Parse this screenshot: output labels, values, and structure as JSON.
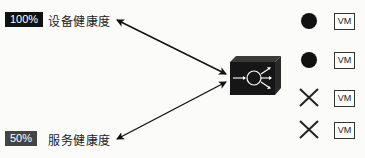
{
  "health": [
    {
      "percent": "100%",
      "label": "设备健康度",
      "badge_color": "#111111"
    },
    {
      "percent": "50%",
      "label": "服务健康度",
      "badge_color": "#444444"
    }
  ],
  "device": {
    "icon": "load-balancer-icon"
  },
  "servers": [
    {
      "status": "up",
      "status_icon": "filled-circle-icon",
      "label": "VM"
    },
    {
      "status": "up",
      "status_icon": "filled-circle-icon",
      "label": "VM"
    },
    {
      "status": "down",
      "status_icon": "x-mark-icon",
      "label": "VM"
    },
    {
      "status": "down",
      "status_icon": "x-mark-icon",
      "label": "VM"
    }
  ]
}
